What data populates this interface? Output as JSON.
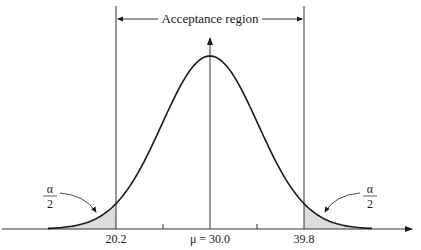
{
  "chart_data": {
    "type": "area",
    "title": "",
    "mean": 30.0,
    "lower_critical_value": 20.2,
    "upper_critical_value": 39.8,
    "x_tick_labels": [
      "20.2",
      "μ = 30.0",
      "39.8"
    ],
    "region_label": "Acceptance region",
    "tail_label_numerator": "α",
    "tail_label_denominator": "2",
    "shaded_regions": [
      "left tail below 20.2",
      "right tail above 39.8"
    ],
    "colors": {
      "curve": "#1a1a1a",
      "shade": "#d9d9d9",
      "axis": "#333333"
    }
  },
  "labels": {
    "acceptance_region": "Acceptance region",
    "lower_critical": "20.2",
    "mean": "μ = 30.0",
    "upper_critical": "39.8",
    "alpha": "α",
    "two": "2"
  }
}
